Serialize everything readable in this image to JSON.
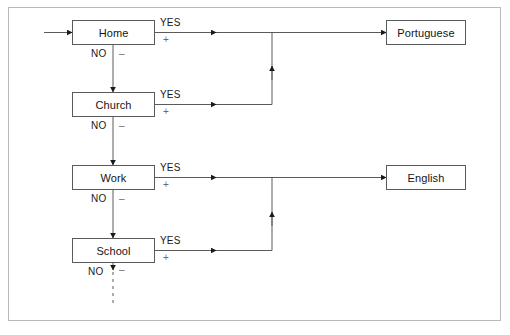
{
  "figure": {
    "frame": {
      "border_color": "#b9b9b9"
    },
    "colors": {
      "box_border": "#5a5a5a",
      "line": "#5a5a5a",
      "label_text": "#1a1a1a",
      "sign_text": "#6b6b6b",
      "background": "#ffffff"
    }
  },
  "nodes": {
    "domains": [
      {
        "id": "home",
        "label": "Home",
        "x": 72,
        "y": 20,
        "w": 83,
        "h": 25
      },
      {
        "id": "church",
        "label": "Church",
        "x": 72,
        "y": 92,
        "w": 83,
        "h": 25
      },
      {
        "id": "work",
        "label": "Work",
        "x": 72,
        "y": 165,
        "w": 83,
        "h": 25
      },
      {
        "id": "school",
        "label": "School",
        "x": 72,
        "y": 238,
        "w": 83,
        "h": 25
      }
    ],
    "outcomes": [
      {
        "id": "portuguese",
        "label": "Portuguese",
        "x": 386,
        "y": 20,
        "w": 80,
        "h": 25
      },
      {
        "id": "english",
        "label": "English",
        "x": 386,
        "y": 165,
        "w": 80,
        "h": 25
      }
    ]
  },
  "edge_labels": {
    "yes": "YES",
    "no": "NO",
    "plus": "+",
    "minus": "–"
  },
  "branches": [
    {
      "from": "home",
      "yes_to": "portuguese",
      "yes": "YES",
      "plus": "+",
      "no": "NO",
      "minus": "–",
      "no_to": "church"
    },
    {
      "from": "church",
      "yes_to": "portuguese",
      "yes": "YES",
      "plus": "+",
      "no": "NO",
      "minus": "–",
      "no_to": "work"
    },
    {
      "from": "work",
      "yes_to": "english",
      "yes": "YES",
      "plus": "+",
      "no": "NO",
      "minus": "–",
      "no_to": "school"
    },
    {
      "from": "school",
      "yes_to": "english",
      "yes": "YES",
      "plus": "+",
      "no": "NO",
      "minus": "–",
      "no_to": "continues"
    }
  ],
  "labels": {
    "home_yes": "YES",
    "home_plus": "+",
    "home_no": "NO",
    "home_minus": "–",
    "church_yes": "YES",
    "church_plus": "+",
    "church_no": "NO",
    "church_minus": "–",
    "work_yes": "YES",
    "work_plus": "+",
    "work_no": "NO",
    "work_minus": "–",
    "school_yes": "YES",
    "school_plus": "+",
    "school_no": "NO",
    "school_minus": "–"
  }
}
